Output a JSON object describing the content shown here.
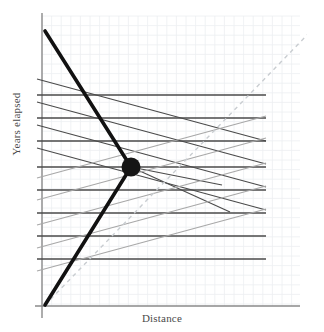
{
  "chart_data": {
    "type": "line",
    "title": "",
    "subtitle": "",
    "xlabel": "Distance",
    "ylabel": "Years elapsed",
    "grid": true,
    "legend": null,
    "annotations": [],
    "axes": {
      "x_axis": {
        "x_start": 35,
        "x_end": 300,
        "y": 306,
        "color": "#8a8a8a"
      },
      "y_axis": {
        "y_start": 13,
        "y_end": 318,
        "x": 42,
        "color": "#8a8a8a"
      },
      "xlim": [
        0,
        1
      ],
      "ylim": [
        0,
        1
      ],
      "ticks_shown": false
    },
    "grid_spec": {
      "cell_px": 9.6,
      "x_min": 42,
      "x_max": 300,
      "y_min": 16,
      "y_max": 306,
      "color": "#eceff1"
    },
    "series": [
      {
        "name": "lines-of-simultaneity-outbound",
        "kind": "horizontal-family",
        "color": "#4a4a4a",
        "width": 1.6,
        "x_start": 37,
        "x_end": 266,
        "y_values": [
          95,
          118,
          141,
          167,
          190,
          213,
          236,
          259
        ]
      },
      {
        "name": "outbound-simultaneity-slopes",
        "kind": "diagonal-family-descending",
        "color": "#4a4a4a",
        "width": 1.1,
        "segments": [
          {
            "x1": 37,
            "y1": 79,
            "x2": 266,
            "y2": 141
          },
          {
            "x1": 37,
            "y1": 102,
            "x2": 266,
            "y2": 164
          },
          {
            "x1": 37,
            "y1": 125,
            "x2": 266,
            "y2": 187
          },
          {
            "x1": 37,
            "y1": 148,
            "x2": 266,
            "y2": 210
          },
          {
            "x1": 131,
            "y1": 167,
            "x2": 230,
            "y2": 212
          },
          {
            "x1": 131,
            "y1": 167,
            "x2": 222,
            "y2": 185
          }
        ]
      },
      {
        "name": "inbound-simultaneity-slopes",
        "kind": "diagonal-family-ascending",
        "color": "#a8a8a8",
        "width": 1.1,
        "segments": [
          {
            "x1": 37,
            "y1": 225,
            "x2": 266,
            "y2": 163
          },
          {
            "x1": 37,
            "y1": 248,
            "x2": 266,
            "y2": 186
          },
          {
            "x1": 37,
            "y1": 271,
            "x2": 266,
            "y2": 209
          },
          {
            "x1": 37,
            "y1": 200,
            "x2": 266,
            "y2": 138
          },
          {
            "x1": 37,
            "y1": 178,
            "x2": 266,
            "y2": 116
          }
        ]
      },
      {
        "name": "light-cone-dashed",
        "kind": "dashed-diagonal",
        "color": "#c9cdd1",
        "width": 1.4,
        "dash": "4 4",
        "x1": 45,
        "y1": 305,
        "x2": 312,
        "y2": 30
      },
      {
        "name": "traveller-worldline",
        "kind": "thick-polyline",
        "color": "#111111",
        "width": 3.6,
        "points": [
          [
            45,
            31
          ],
          [
            131,
            167
          ],
          [
            45,
            305
          ]
        ]
      }
    ],
    "markers": [
      {
        "name": "turnaround-event",
        "x": 131,
        "y": 167,
        "radius": 9.5,
        "color": "#151515"
      }
    ]
  },
  "labels": {
    "x_axis": "Distance",
    "y_axis": "Years elapsed"
  },
  "colors": {
    "grid": "#eceff1",
    "axis": "#8a8a8a",
    "dark_line": "#4a4a4a",
    "light_line": "#a8a8a8",
    "dashed": "#c9cdd1",
    "worldline": "#111111",
    "marker": "#151515",
    "text": "#4a4a4a",
    "background": "#ffffff"
  }
}
